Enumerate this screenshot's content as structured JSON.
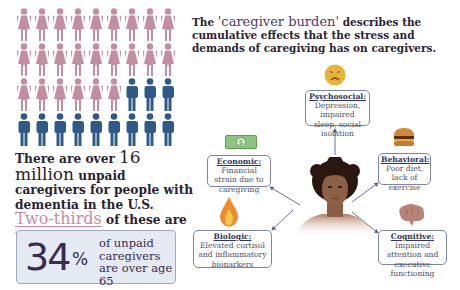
{
  "colors": {
    "women": "#c48ea2",
    "men": "#2e5a85",
    "accent_pink": "#c98ca2",
    "stat_box_bg": "#e5e9f2",
    "box_border": "#7c86a4",
    "dark_text": "#2b2233"
  },
  "people_grid": {
    "columns": 9,
    "rows": 4,
    "women_count": 24,
    "men_count": 12,
    "layout": [
      [
        "woman",
        "woman",
        "woman",
        "woman",
        "woman",
        "woman",
        "woman",
        "woman",
        "woman"
      ],
      [
        "woman",
        "woman",
        "woman",
        "woman",
        "woman",
        "woman",
        "woman",
        "woman",
        "woman"
      ],
      [
        "woman",
        "woman",
        "woman",
        "woman",
        "woman",
        "woman",
        "man",
        "man",
        "man"
      ],
      [
        "man",
        "man",
        "man",
        "man",
        "man",
        "man",
        "man",
        "man",
        "man"
      ]
    ]
  },
  "left_panel": {
    "line1_prefix": "There are over ",
    "line1_number": "16 million",
    "line2": "unpaid caregivers for people with dementia in the U.S.",
    "two_thirds": "Two-thirds",
    "line3_suffix": " of these are",
    "women_word": "women."
  },
  "stat_box": {
    "value": "34",
    "unit": "%",
    "text": "of unpaid caregivers are over age 65"
  },
  "heading": {
    "prefix": "The ",
    "highlight": "'caregiver burden'",
    "suffix": " describes the cumulative effects that the stress and demands of caregiving has on caregivers."
  },
  "center_figure": {
    "icon": "caregiver-portrait"
  },
  "burden_boxes": {
    "psychosocial": {
      "title": "Psychosocial:",
      "text": "Depression, impaired sleep, social isolation",
      "icon": "sad-face-emoji"
    },
    "economic": {
      "title": "Economic:",
      "text": "Financial strain due to caregiving",
      "icon": "dollar-bill"
    },
    "behavioral": {
      "title": "Behavioral:",
      "text": "Poor diet, lack of exercise",
      "icon": "hamburger"
    },
    "biologic": {
      "title": "Biologic:",
      "text": "Elevated cortisol and inflammatory bionarkers",
      "icon": "flame"
    },
    "cognitive": {
      "title": "Cognitive:",
      "text": "Impaired attention and executive functioning",
      "icon": "brain"
    }
  }
}
